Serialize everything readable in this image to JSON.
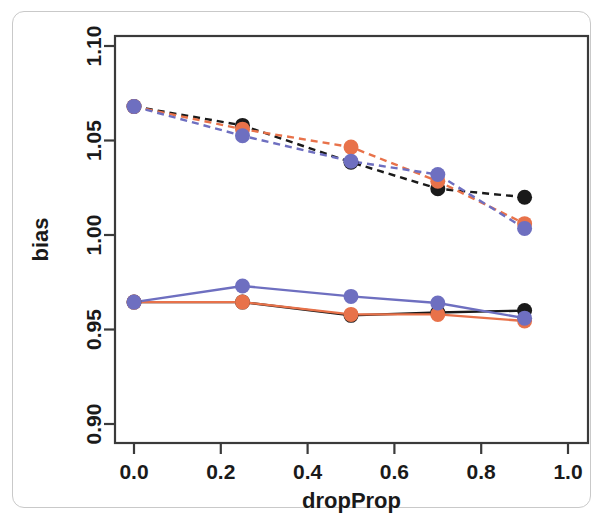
{
  "chart_data": {
    "type": "line",
    "title": "",
    "xlabel": "dropProp",
    "ylabel": "bias",
    "xlim": [
      0.0,
      1.0
    ],
    "ylim": [
      0.9,
      1.1
    ],
    "xticks": [
      0.0,
      0.2,
      0.4,
      0.6,
      0.8,
      1.0
    ],
    "xtick_labels": [
      "0.0",
      "0.2",
      "0.4",
      "0.6",
      "0.8",
      "1.0"
    ],
    "yticks": [
      0.9,
      0.95,
      1.0,
      1.05,
      1.1
    ],
    "ytick_labels": [
      "0.90",
      "0.95",
      "1.00",
      "1.05",
      "1.10"
    ],
    "grid": false,
    "legend": "none",
    "x": [
      0.0,
      0.25,
      0.5,
      0.7,
      0.9
    ],
    "colors": {
      "black": "#1a1a1a",
      "orange": "#e8724a",
      "blue": "#6e6fc0"
    },
    "series": [
      {
        "name": "black-dashed",
        "color": "#1a1a1a",
        "style": "dashed",
        "marker": "circle",
        "values": [
          1.068,
          1.058,
          1.0385,
          1.0245,
          1.02
        ]
      },
      {
        "name": "orange-dashed",
        "color": "#e8724a",
        "style": "dashed",
        "marker": "circle",
        "values": [
          1.068,
          1.056,
          1.0465,
          1.0285,
          1.006
        ]
      },
      {
        "name": "blue-dashed",
        "color": "#6e6fc0",
        "style": "dashed",
        "marker": "circle",
        "values": [
          1.068,
          1.0525,
          1.039,
          1.032,
          1.0035
        ]
      },
      {
        "name": "black-solid",
        "color": "#1a1a1a",
        "style": "solid",
        "marker": "circle",
        "values": [
          0.9645,
          0.9645,
          0.9575,
          0.959,
          0.96
        ]
      },
      {
        "name": "orange-solid",
        "color": "#e8724a",
        "style": "solid",
        "marker": "circle",
        "values": [
          0.9645,
          0.9645,
          0.958,
          0.958,
          0.9545
        ]
      },
      {
        "name": "blue-solid",
        "color": "#6e6fc0",
        "style": "solid",
        "marker": "circle",
        "values": [
          0.9645,
          0.973,
          0.9675,
          0.964,
          0.956
        ]
      }
    ]
  }
}
